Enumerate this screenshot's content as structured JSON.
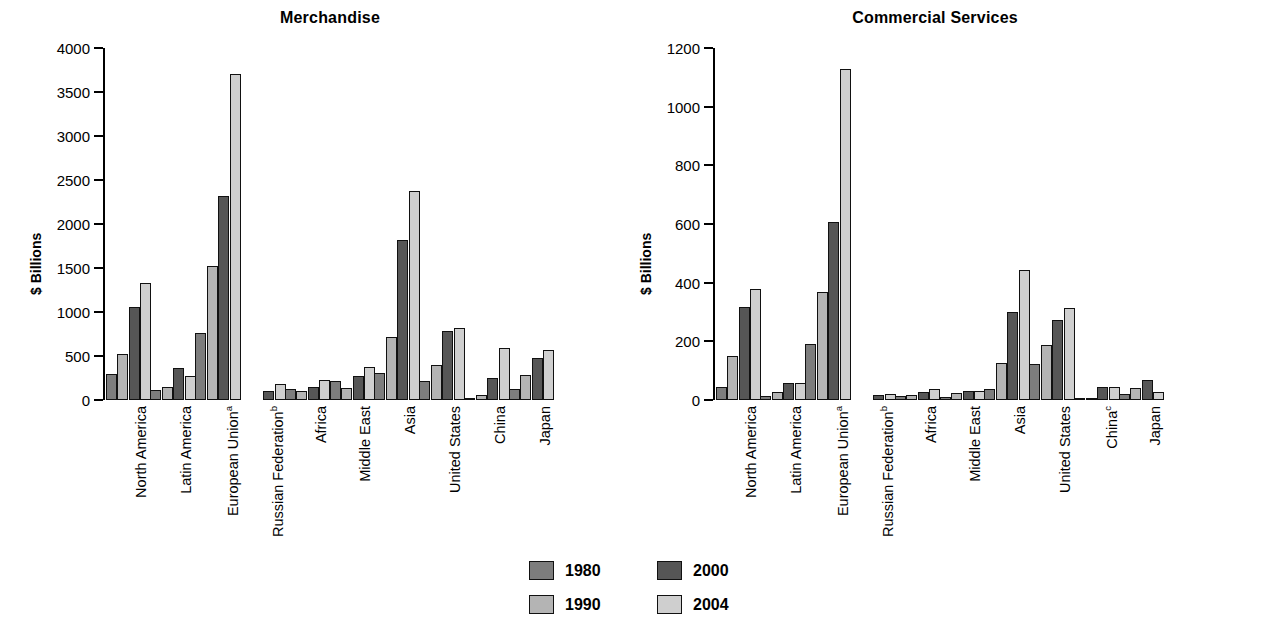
{
  "ylabel": "$ Billions",
  "legend": {
    "items": [
      {
        "label": "1980",
        "color": "#7d7d7d",
        "key": "s1980"
      },
      {
        "label": "1990",
        "color": "#b4b4b4",
        "key": "s1990"
      },
      {
        "label": "2000",
        "color": "#565656",
        "key": "s2000"
      },
      {
        "label": "2004",
        "color": "#cfcfcf",
        "key": "s2004"
      }
    ]
  },
  "chart_data": [
    {
      "type": "bar",
      "title": "Merchandise",
      "xlabel": "",
      "ylabel": "$ Billions",
      "ylim": [
        0,
        4000
      ],
      "yticks": [
        0,
        500,
        1000,
        1500,
        2000,
        2500,
        3000,
        3500,
        4000
      ],
      "grid": false,
      "legend_position": "bottom-center",
      "categories": [
        "North America",
        "Latin America",
        "European Union",
        "Russian Federation",
        "Africa",
        "Middle East",
        "Asia",
        "United States",
        "China",
        "Japan"
      ],
      "category_notes": [
        "",
        "",
        "a",
        "b",
        "",
        "",
        "",
        "",
        "",
        ""
      ],
      "series": [
        {
          "name": "1980",
          "values": [
            296,
            109,
            760,
            null,
            124,
            211,
            305,
            221,
            18,
            130
          ]
        },
        {
          "name": "1990",
          "values": [
            522,
            147,
            1520,
            null,
            106,
            139,
            721,
            393,
            62,
            288
          ]
        },
        {
          "name": "2000",
          "values": [
            1059,
            360,
            2320,
            105,
            149,
            268,
            1820,
            782,
            249,
            479
          ]
        },
        {
          "name": "2004",
          "values": [
            1331,
            276,
            3710,
            183,
            232,
            379,
            2370,
            819,
            593,
            565
          ]
        }
      ]
    },
    {
      "type": "bar",
      "title": "Commercial Services",
      "xlabel": "",
      "ylabel": "$ Billions",
      "ylim": [
        0,
        1200
      ],
      "yticks": [
        0,
        200,
        400,
        600,
        800,
        1000,
        1200
      ],
      "grid": false,
      "legend_position": "bottom-center",
      "categories": [
        "North America",
        "Latin America",
        "European Union",
        "Russian Federation",
        "Africa",
        "Middle East",
        "Asia",
        "United States",
        "China",
        "Japan"
      ],
      "category_notes": [
        "",
        "",
        "a",
        "b",
        "",
        "",
        "",
        "",
        "c",
        ""
      ],
      "series": [
        {
          "name": "1980",
          "values": [
            46,
            15,
            190,
            null,
            13,
            10,
            38,
            124,
            3,
            20
          ]
        },
        {
          "name": "1990",
          "values": [
            151,
            29,
            368,
            null,
            17,
            24,
            126,
            186,
            6,
            42
          ]
        },
        {
          "name": "2000",
          "values": [
            316,
            57,
            606,
            16,
            29,
            30,
            300,
            274,
            45,
            69
          ]
        },
        {
          "name": "2004",
          "values": [
            380,
            57,
            1130,
            21,
            39,
            32,
            443,
            313,
            46,
            29
          ]
        }
      ]
    }
  ]
}
